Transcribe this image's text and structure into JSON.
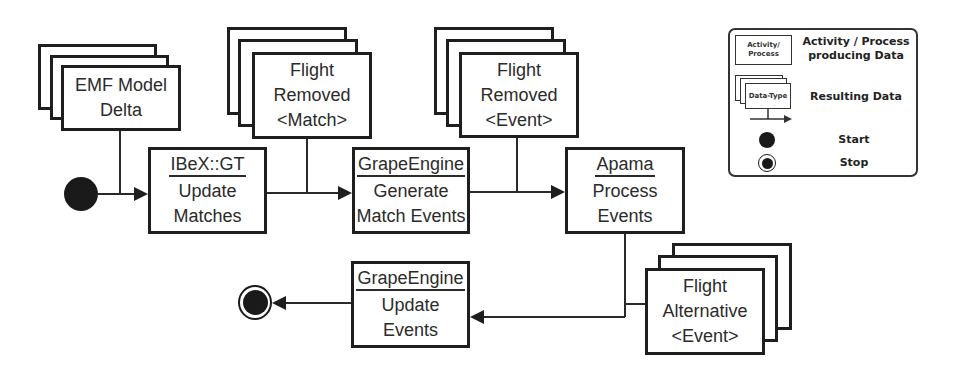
{
  "diagram": {
    "activities": {
      "ibex_update": {
        "tool": "IBeX::GT",
        "lines": [
          "Update",
          "Matches"
        ]
      },
      "grape_generate": {
        "tool": "GrapeEngine",
        "lines": [
          "Generate",
          "Match Events"
        ]
      },
      "apama_process": {
        "tool": "Apama",
        "lines": [
          "Process",
          "Events"
        ]
      },
      "grape_update": {
        "tool": "GrapeEngine",
        "lines": [
          "Update",
          "Events"
        ]
      }
    },
    "data": {
      "emf_delta": {
        "lines": [
          "EMF Model",
          "Delta"
        ]
      },
      "flight_removed_match": {
        "lines": [
          "Flight",
          "Removed",
          "<Match>"
        ]
      },
      "flight_removed_event": {
        "lines": [
          "Flight",
          "Removed",
          "<Event>"
        ]
      },
      "flight_alternative_event": {
        "lines": [
          "Flight",
          "Alternative",
          "<Event>"
        ]
      }
    },
    "icons": {
      "start": "start-node-filled-circle",
      "stop": "stop-node-bullseye"
    }
  },
  "legend": {
    "activity_sample": [
      "Activity/",
      "Process"
    ],
    "activity_desc": [
      "Activity / Process",
      "producing Data"
    ],
    "data_sample": "Data-Type",
    "data_desc": "Resulting Data",
    "start_label": "Start",
    "stop_label": "Stop"
  },
  "colors": {
    "line": "#222222",
    "text": "#2b2b2b",
    "background": "#ffffff"
  }
}
